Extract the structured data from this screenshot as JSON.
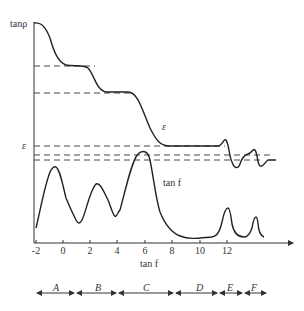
{
  "diagram": {
    "y_axis_label": "tanρ",
    "y_axis_tick_label": "ε",
    "x_axis_label": "tan f",
    "curve_labels": {
      "epsilon": "ε",
      "tan_f": "tan f"
    },
    "x_ticks": [
      "-2",
      "0",
      "2",
      "4",
      "6",
      "8",
      "10",
      "12"
    ],
    "regions": [
      "A",
      "B",
      "C",
      "D",
      "E",
      "F"
    ],
    "colors": {
      "line": "#222222",
      "text": "#333333",
      "background": "#ffffff"
    }
  }
}
